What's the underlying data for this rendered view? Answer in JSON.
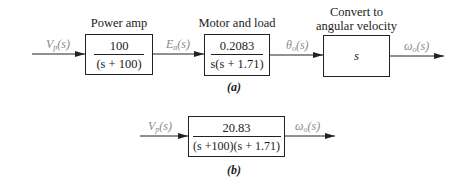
{
  "panel_a": {
    "caption": "(a)",
    "input_signal": {
      "var": "V",
      "sub": "p",
      "arg": "(s)"
    },
    "blocks": [
      {
        "label": "Power amp",
        "numerator": "100",
        "denominator": "(s + 100)"
      },
      {
        "label": "Motor and load",
        "numerator": "0.2083",
        "denominator": "s(s + 1.71)"
      },
      {
        "label_line1": "Convert to",
        "label_line2": "angular velocity",
        "tf": "s"
      }
    ],
    "signals": [
      {
        "var": "E",
        "sub": "a",
        "arg": "(s)"
      },
      {
        "var": "θ",
        "sub": "o",
        "arg": "(s)"
      },
      {
        "var": "ω",
        "sub": "o",
        "arg": "(s)"
      }
    ]
  },
  "panel_b": {
    "caption": "(b)",
    "input_signal": {
      "var": "V",
      "sub": "p",
      "arg": "(s)"
    },
    "block": {
      "numerator": "20.83",
      "denominator": "(s +100)(s + 1.71)"
    },
    "output_signal": {
      "var": "ω",
      "sub": "o",
      "arg": "(s)"
    }
  },
  "colors": {
    "line": "#222222",
    "signal_label": "#8a8a8a"
  }
}
